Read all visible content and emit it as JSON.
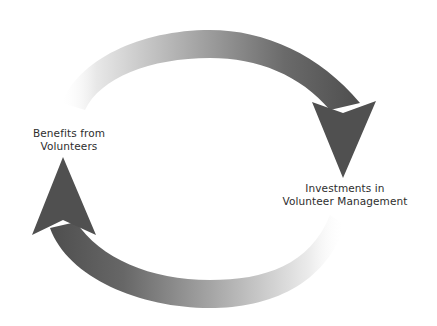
{
  "diagram": {
    "type": "cycle",
    "nodes": [
      {
        "id": "benefits",
        "label_lines": [
          "Benefits from",
          "Volunteers"
        ]
      },
      {
        "id": "investments",
        "label_lines": [
          "Investments in",
          "Volunteer Management"
        ]
      }
    ],
    "edges": [
      {
        "from": "benefits",
        "to": "investments",
        "path": "top-arc",
        "style": "gradient light-to-dark"
      },
      {
        "from": "investments",
        "to": "benefits",
        "path": "bottom-arc",
        "style": "gradient light-to-dark"
      }
    ],
    "colors": {
      "arrow_dark": "#4a4a4a",
      "arrow_light": "#ffffff",
      "text": "#2e2e2e",
      "background": "#ffffff"
    }
  }
}
